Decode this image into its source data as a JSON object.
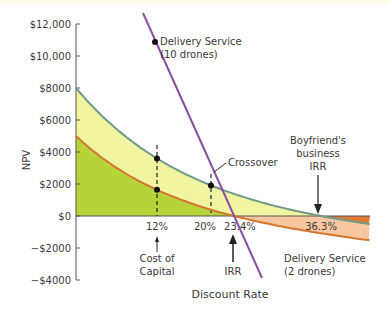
{
  "chart_data": {
    "type": "line",
    "title": "",
    "xlabel": "Discount Rate",
    "ylabel": "NPV",
    "ylim": [
      -4000,
      12000
    ],
    "xlim": [
      0,
      45
    ],
    "y_ticks": [
      "$12,000",
      "$10,000",
      "$8000",
      "$6000",
      "$4000",
      "$2000",
      "$0",
      "−$2000",
      "−$4000"
    ],
    "y_tick_values": [
      12000,
      10000,
      8000,
      6000,
      4000,
      2000,
      0,
      -2000,
      -4000
    ],
    "x_tick_labels": [
      "12%",
      "20%",
      "23.4%",
      "36.3%"
    ],
    "x_tick_values": [
      12,
      20,
      23.4,
      36.3
    ],
    "series": [
      {
        "name": "Delivery Service (10 drones)",
        "color": "#8a4f9e",
        "x": [
          10,
          12,
          20,
          23.4,
          28
        ],
        "values": [
          10000,
          8800,
          2600,
          0,
          -3900
        ]
      },
      {
        "name": "Boyfriend's business",
        "color": "#6f9a86",
        "x": [
          0,
          12,
          20,
          36.3,
          45
        ],
        "values": [
          8000,
          4400,
          2600,
          0,
          -800
        ]
      },
      {
        "name": "Delivery Service (2 drones)",
        "color": "#d4752e",
        "x": [
          0,
          12,
          20,
          23.4,
          36.3,
          45
        ],
        "values": [
          5000,
          2000,
          700,
          0,
          -1800,
          -2200
        ]
      }
    ],
    "points": [
      {
        "label": "Delivery Service (10 drones)",
        "x": 10,
        "y": 10000
      },
      {
        "label": "12% upper",
        "x": 12,
        "y": 4400
      },
      {
        "label": "12% lower",
        "x": 12,
        "y": 2000
      },
      {
        "label": "Crossover",
        "x": 20,
        "y": 2600
      }
    ],
    "annotations": [
      {
        "text": "Delivery Service",
        "text2": "(10 drones)"
      },
      {
        "text": "Crossover"
      },
      {
        "text": "Boyfriend's",
        "text2": "business",
        "text3": "IRR"
      },
      {
        "text": "Cost of",
        "text2": "Capital"
      },
      {
        "text": "IRR"
      },
      {
        "text": "Delivery Service",
        "text2": "(2 drones)"
      }
    ],
    "grid": false,
    "legend": "none"
  }
}
